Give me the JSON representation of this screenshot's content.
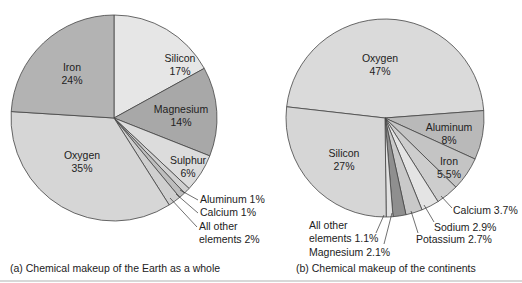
{
  "chart_data": [
    {
      "type": "pie",
      "title": "(a) Chemical makeup of the Earth as a whole",
      "categories": [
        "Silicon",
        "Magnesium",
        "Sulphur",
        "Aluminum",
        "Calcium",
        "All other elements",
        "Oxygen",
        "Iron"
      ],
      "values": [
        17,
        14,
        6,
        1,
        1,
        2,
        35,
        24
      ],
      "unit": "%",
      "colors": [
        "#e6e6e6",
        "#a8a8a8",
        "#dcdcdc",
        "#d0d0d0",
        "#bdbdbd",
        "#cfcfcf",
        "#d6d6d6",
        "#b3b3b3"
      ],
      "labels": {
        "silicon": [
          "Silicon",
          "17%"
        ],
        "magnesium": [
          "Magnesium",
          "14%"
        ],
        "sulphur": [
          "Sulphur",
          "6%"
        ],
        "aluminum": "Aluminum 1%",
        "calcium": "Calcium 1%",
        "other": [
          "All other",
          "elements 2%"
        ],
        "oxygen": [
          "Oxygen",
          "35%"
        ],
        "iron": [
          "Iron",
          "24%"
        ]
      }
    },
    {
      "type": "pie",
      "title": "(b) Chemical makeup of the continents",
      "categories": [
        "Oxygen",
        "Aluminum",
        "Iron",
        "Calcium",
        "Sodium",
        "Potassium",
        "Magnesium",
        "All other elements",
        "Silicon"
      ],
      "values": [
        47,
        8,
        5.5,
        3.7,
        2.9,
        2.7,
        2.1,
        1.1,
        27
      ],
      "unit": "%",
      "colors": [
        "#dadada",
        "#b9b9b9",
        "#c4c4c4",
        "#cdcdcd",
        "#e4e4e4",
        "#c9c9c9",
        "#8f8f8f",
        "#e2e2e2",
        "#d6d6d6"
      ],
      "labels": {
        "oxygen": [
          "Oxygen",
          "47%"
        ],
        "aluminum": [
          "Aluminum",
          "8%"
        ],
        "iron": [
          "Iron",
          "5.5%"
        ],
        "calcium": "Calcium 3.7%",
        "sodium": "Sodium 2.9%",
        "potassium": "Potassium 2.7%",
        "magnesium": "Magnesium 2.1%",
        "other": [
          "All other",
          "elements 1.1%"
        ],
        "silicon": [
          "Silicon",
          "27%"
        ]
      }
    }
  ],
  "captions": {
    "a": "(a) Chemical makeup of the Earth as a whole",
    "b": "(b) Chemical makeup of the continents"
  }
}
